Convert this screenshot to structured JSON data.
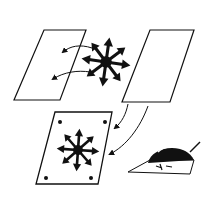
{
  "diagram": {
    "colors": {
      "background": "#ffffff",
      "ink": "#111111"
    },
    "elements": [
      {
        "id": "sheet-left",
        "label": "blank sheet (left)"
      },
      {
        "id": "star-symbol",
        "label": "8-point arrow star"
      },
      {
        "id": "sheet-right",
        "label": "blank sheet (right)"
      },
      {
        "id": "result-sheet",
        "label": "sheet with star and 4 corner dots"
      },
      {
        "id": "iron-sketch",
        "label": "iron pressing transfer"
      }
    ],
    "arrows": [
      {
        "from": "star-symbol",
        "to": "sheet-left",
        "count": 2
      },
      {
        "from": "sheet-right",
        "to": "result-sheet",
        "count": 2
      }
    ]
  }
}
